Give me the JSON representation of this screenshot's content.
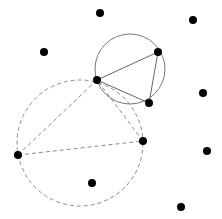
{
  "canvas": {
    "width": 222,
    "height": 219,
    "background": "#ffffff"
  },
  "colors": {
    "point": "#000000",
    "solid_stroke": "#666666",
    "dashed_stroke": "#8a8a8a"
  },
  "points": [
    {
      "id": "p1",
      "x": 100,
      "y": 13
    },
    {
      "id": "p2",
      "x": 193,
      "y": 20
    },
    {
      "id": "p3",
      "x": 44,
      "y": 52
    },
    {
      "id": "p4",
      "x": 158,
      "y": 52
    },
    {
      "id": "p5",
      "x": 97,
      "y": 80
    },
    {
      "id": "p6",
      "x": 149,
      "y": 103
    },
    {
      "id": "p7",
      "x": 203,
      "y": 93
    },
    {
      "id": "p8",
      "x": 18,
      "y": 155
    },
    {
      "id": "p9",
      "x": 143,
      "y": 141
    },
    {
      "id": "p10",
      "x": 92,
      "y": 183
    },
    {
      "id": "p11",
      "x": 207,
      "y": 151
    },
    {
      "id": "p12",
      "x": 181,
      "y": 207
    }
  ],
  "circles": [
    {
      "id": "circumcircle-solid",
      "style": "solid",
      "cx": 130,
      "cy": 69,
      "r": 35
    },
    {
      "id": "circumcircle-dashed",
      "style": "dashed",
      "cx": 80,
      "cy": 143,
      "r": 63
    }
  ],
  "edges": [
    {
      "id": "solid-p5-p4",
      "style": "solid",
      "from": "p5",
      "to": "p4"
    },
    {
      "id": "solid-p4-p6",
      "style": "solid",
      "from": "p4",
      "to": "p6"
    },
    {
      "id": "solid-p6-p5",
      "style": "solid",
      "from": "p6",
      "to": "p5"
    },
    {
      "id": "dashed-p5-p8",
      "style": "dashed",
      "from": "p5",
      "to": "p8"
    },
    {
      "id": "dashed-p8-p9",
      "style": "dashed",
      "from": "p8",
      "to": "p9"
    },
    {
      "id": "dashed-p9-p5",
      "style": "dashed",
      "from": "p9",
      "to": "p5"
    }
  ],
  "point_radius": 4
}
